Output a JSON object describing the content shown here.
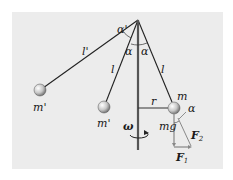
{
  "figure": {
    "background_color": "#ececec",
    "labels": {
      "alpha_prime": "α'",
      "alpha_left": "α",
      "alpha_right": "α",
      "l_prime": "l'",
      "l_left": "l",
      "l_right": "l",
      "mass_left_far": "m'",
      "mass_left_near": "m'",
      "mass_right": "m",
      "radius": "r",
      "omega": "ω",
      "weight": "mg",
      "alpha_force": "α",
      "F2": "F",
      "F2_sub": "2",
      "F1": "F",
      "F1_sub": "1"
    }
  }
}
